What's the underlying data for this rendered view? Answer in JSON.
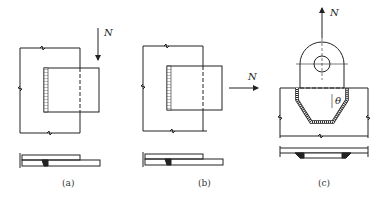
{
  "figure": {
    "panels": [
      {
        "id": "a",
        "caption": "(a)",
        "force_label": "N",
        "force_direction": "down"
      },
      {
        "id": "b",
        "caption": "(b)",
        "force_label": "N",
        "force_direction": "right"
      },
      {
        "id": "c",
        "caption": "(c)",
        "force_label_up": "N",
        "force_label_side": "N",
        "angle_label": "θ"
      }
    ],
    "colors": {
      "line": "#222222",
      "background": "#ffffff"
    }
  }
}
